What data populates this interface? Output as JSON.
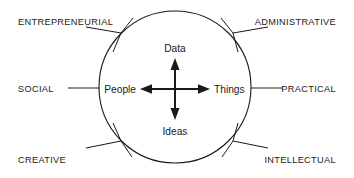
{
  "diagram": {
    "background_color": "#ffffff",
    "line_color": "#1a1a1a",
    "text_color": "#1a1a1a",
    "circle": {
      "center_x": 175,
      "center_y": 87,
      "radius": 76
    },
    "outer_labels": [
      {
        "id": "entrepreneurial",
        "text": "ENTREPRENEURIAL",
        "position": "top-left"
      },
      {
        "id": "administrative",
        "text": "ADMINISTRATIVE",
        "position": "top-right"
      },
      {
        "id": "social",
        "text": "SOCIAL",
        "position": "left"
      },
      {
        "id": "practical",
        "text": "PRACTICAL",
        "position": "right"
      },
      {
        "id": "creative",
        "text": "CREATIVE",
        "position": "bottom-left"
      },
      {
        "id": "intellectual",
        "text": "INTELLECTUAL",
        "position": "bottom-right"
      }
    ],
    "axis_labels": [
      {
        "id": "data",
        "text": "Data",
        "position": "top"
      },
      {
        "id": "people",
        "text": "People",
        "position": "left"
      },
      {
        "id": "things",
        "text": "Things",
        "position": "right"
      },
      {
        "id": "ideas",
        "text": "Ideas",
        "position": "bottom"
      }
    ],
    "axes": [
      {
        "id": "vertical-axis",
        "from": "Ideas",
        "to": "Data",
        "arrows": "both"
      },
      {
        "id": "horizontal-axis",
        "from": "People",
        "to": "Things",
        "arrows": "both"
      }
    ]
  }
}
